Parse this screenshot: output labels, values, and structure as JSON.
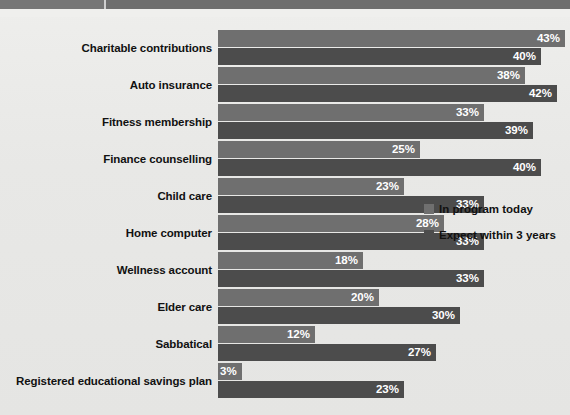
{
  "topbar": {
    "segment_left_label": "",
    "segment_right_label": ""
  },
  "legend": {
    "position": "right-middle",
    "items": [
      {
        "label": "In program today",
        "color": "#6f6f6f",
        "swatch": "legend-swatch-icon"
      },
      {
        "label": "Expect within 3 years",
        "color": "#4c4c4c",
        "swatch": "legend-swatch-icon"
      }
    ]
  },
  "chart_data": {
    "type": "bar",
    "orientation": "horizontal",
    "title": "",
    "subtitle": "",
    "xlabel": "",
    "ylabel": "",
    "grid": false,
    "legend_position": "right-middle",
    "xlim": [
      0,
      43
    ],
    "value_suffix": "%",
    "categories": [
      "Charitable contributions",
      "Auto insurance",
      "Fitness membership",
      "Finance counselling",
      "Child care",
      "Home computer",
      "Wellness account",
      "Elder care",
      "Sabbatical",
      "Registered educational savings plan"
    ],
    "series": [
      {
        "name": "In program today",
        "color": "#6f6f6f",
        "values": [
          43,
          38,
          33,
          25,
          23,
          28,
          18,
          20,
          12,
          3
        ],
        "labels": [
          "43%",
          "38%",
          "33%",
          "25%",
          "23%",
          "28%",
          "18%",
          "20%",
          "12%",
          "3%"
        ]
      },
      {
        "name": "Expect within 3 years",
        "color": "#4c4c4c",
        "values": [
          40,
          42,
          39,
          40,
          33,
          33,
          33,
          30,
          27,
          23
        ],
        "labels": [
          "40%",
          "42%",
          "39%",
          "40%",
          "33%",
          "33%",
          "33%",
          "30%",
          "27%",
          "23%"
        ]
      }
    ]
  }
}
